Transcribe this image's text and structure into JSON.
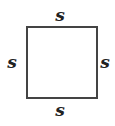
{
  "diagram": {
    "shape": "square",
    "stroke_color": "#444444",
    "labels": {
      "top": "s",
      "left": "s",
      "right": "s",
      "bottom": "s"
    }
  }
}
